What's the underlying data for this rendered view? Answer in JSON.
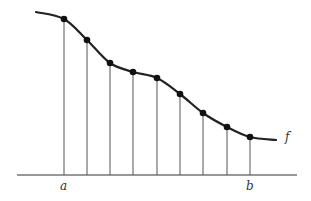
{
  "diagram": {
    "type": "riemann-partition",
    "function_label": "f",
    "interval_start_label": "a",
    "interval_end_label": "b",
    "axis": {
      "x1": 17,
      "x2": 297,
      "y": 175
    },
    "curve_start": [
      36,
      12
    ],
    "curve_end": [
      276,
      140
    ],
    "points": [
      [
        64,
        19
      ],
      [
        87,
        40
      ],
      [
        110,
        63
      ],
      [
        133,
        72
      ],
      [
        157,
        78
      ],
      [
        180,
        94
      ],
      [
        203,
        113
      ],
      [
        227,
        127
      ],
      [
        250,
        137
      ]
    ],
    "colors": {
      "curve": "#222222",
      "line": "#555555",
      "point": "#111111",
      "axis": "#333333"
    }
  }
}
